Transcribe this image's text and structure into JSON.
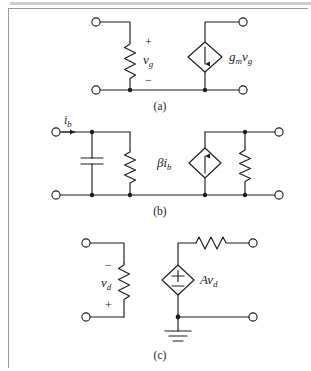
{
  "figure": {
    "kind": "circuit-diagram-figure",
    "background_color": "#ffffff",
    "line_color": "#1d1d1d",
    "frame_color": "#9a9a9a",
    "panel_count": 3
  },
  "captions": {
    "a": "(a)",
    "b": "(b)",
    "c": "(c)"
  },
  "panel_a": {
    "caption": "(a)",
    "description": "Voltage-controlled current source model: resistor across input port, dependent current source across output port",
    "elements": {
      "resistor_label": "v_g",
      "resistor_voltage_variable": "vg",
      "polarity_top": "+",
      "polarity_bottom": "−",
      "source_label_gain": "g",
      "source_label_gain_sub": "m",
      "source_label_var": "v",
      "source_label_var_sub": "g",
      "source_label_full": "gₘv_g",
      "source_type": "dependent-current-source",
      "source_arrow_direction": "down",
      "terminals": 4
    }
  },
  "panel_b": {
    "caption": "(b)",
    "description": "Hybrid-pi model: capacitor and resistor in parallel at input, dependent current source and resistor in parallel at output",
    "elements": {
      "input_current_label": "i",
      "input_current_sub": "b",
      "input_current_full": "i_b",
      "input_current_arrow_direction": "right",
      "capacitor": "capacitor",
      "input_resistor": "resistor",
      "source_label_gain": "β",
      "source_label_var": "i",
      "source_label_var_sub": "b",
      "source_label_full": "βi_b",
      "source_type": "dependent-current-source",
      "source_arrow_direction": "up",
      "output_resistor": "resistor",
      "terminals": 4
    }
  },
  "panel_c": {
    "caption": "(c)",
    "description": "Voltage-controlled voltage source model: input resistor with reversed polarity, dependent voltage source in series with output resistor, grounded node",
    "elements": {
      "resistor_label": "v_d",
      "resistor_voltage_variable": "vd",
      "polarity_top": "−",
      "polarity_bottom": "+",
      "source_label_gain": "A",
      "source_label_var": "v",
      "source_label_var_sub": "d",
      "source_label_full": "Av_d",
      "source_type": "dependent-voltage-source",
      "source_symbol": "±",
      "series_resistor": "resistor",
      "ground": "ground-symbol",
      "terminals": 4
    }
  }
}
